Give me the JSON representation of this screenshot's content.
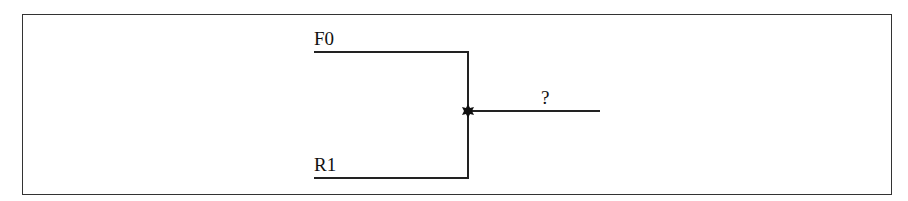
{
  "diagram": {
    "type": "circuit-junction",
    "inputs": [
      {
        "label": "F0",
        "position": "top"
      },
      {
        "label": "R1",
        "position": "bottom"
      }
    ],
    "output": {
      "label": "?"
    },
    "junction_symbol": "star-dot-icon",
    "colors": {
      "line": "#222222",
      "border": "#333333",
      "background": "#ffffff"
    }
  }
}
